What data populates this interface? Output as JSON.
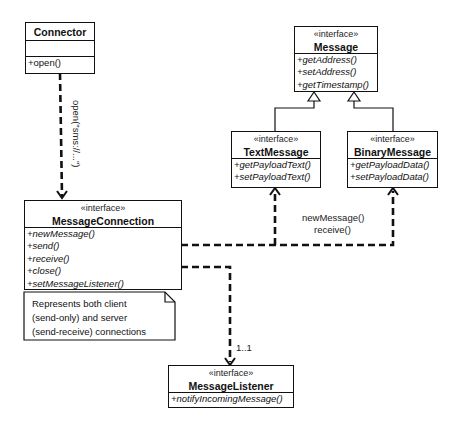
{
  "classes": {
    "connector": {
      "name": "Connector",
      "operations": [
        "+open()"
      ]
    },
    "message": {
      "stereotype": "«interface»",
      "name": "Message",
      "operations": [
        "+getAddress()",
        "+setAddress()",
        "+getTimestamp()"
      ]
    },
    "text_message": {
      "stereotype": "«interface»",
      "name": "TextMessage",
      "operations": [
        "+getPayloadText()",
        "+setPayloadText()"
      ]
    },
    "binary_message": {
      "stereotype": "«interface»",
      "name": "BinaryMessage",
      "operations": [
        "+getPayloadData()",
        "+setPayloadData()"
      ]
    },
    "message_connection": {
      "stereotype": "«interface»",
      "name": "MessageConnection",
      "operations": [
        "+newMessage()",
        "+send()",
        "+receive()",
        "+close()",
        "+setMessageListener()"
      ]
    },
    "message_listener": {
      "stereotype": "«interface»",
      "name": "MessageListener",
      "operations": [
        "+notifyIncomingMessage()"
      ]
    }
  },
  "note": {
    "lines": [
      "Represents both client",
      "(send-only) and server",
      "(send-receive) connections"
    ]
  },
  "edges": {
    "connector_to_connection": "open(\"sms://...\")",
    "connection_to_messages": [
      "newMessage()",
      "receive()"
    ],
    "connection_to_listener": "1..1"
  }
}
